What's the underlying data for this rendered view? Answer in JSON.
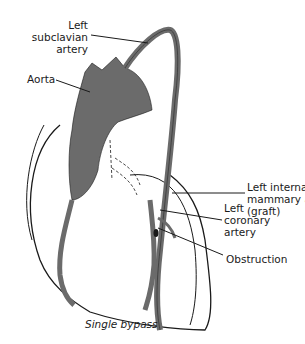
{
  "diagram": {
    "caption": "Single bypass",
    "colors": {
      "vessel": "#6b6b6b",
      "outline": "#1a1a1a",
      "background": "#ffffff"
    },
    "labels": {
      "subclavian": {
        "line1": "Left",
        "line2": "subclavian",
        "line3": "artery"
      },
      "aorta": {
        "line1": "Aorta"
      },
      "mammary": {
        "line1": "Left internal",
        "line2": "mammary artery",
        "line3": "(graft)"
      },
      "coronary": {
        "line1": "Left",
        "line2": "coronary",
        "line3": "artery"
      },
      "obstruction": {
        "line1": "Obstruction"
      }
    }
  }
}
